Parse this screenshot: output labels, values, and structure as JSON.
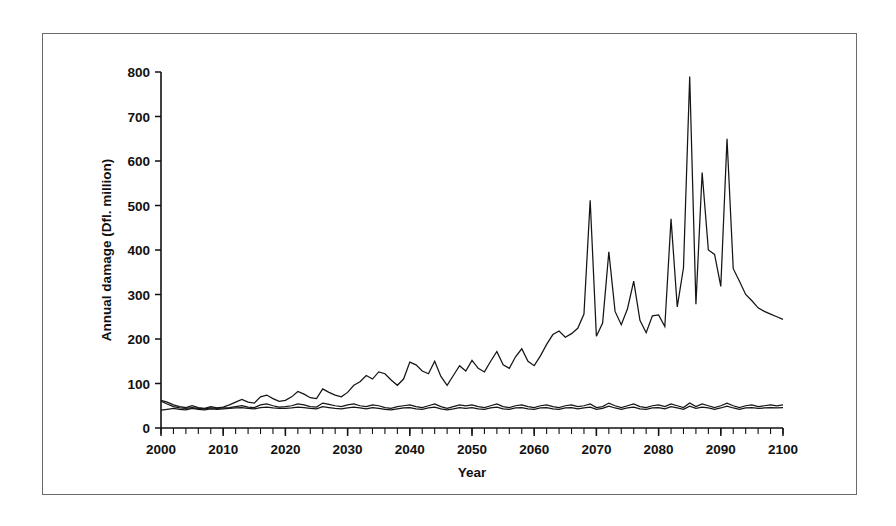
{
  "figure": {
    "border_color": "#6a6a6a",
    "background": "#ffffff"
  },
  "chart_data": {
    "type": "line",
    "title": "",
    "subtitle": "",
    "xlabel": "Year",
    "ylabel": "Annual damage (Dfl. million)",
    "xlim": [
      2000,
      2100
    ],
    "ylim": [
      0,
      800
    ],
    "xticks": [
      2000,
      2010,
      2020,
      2030,
      2040,
      2050,
      2060,
      2070,
      2080,
      2090,
      2100
    ],
    "xtick_labels": [
      "2000",
      "2010",
      "2020",
      "2030",
      "2040",
      "2050",
      "2060",
      "2070",
      "2080",
      "2090",
      "2100"
    ],
    "x_minor_tick_interval": 2,
    "yticks": [
      0,
      100,
      200,
      300,
      400,
      500,
      600,
      700,
      800
    ],
    "ytick_labels": [
      "0",
      "100",
      "200",
      "300",
      "400",
      "500",
      "600",
      "700",
      "800"
    ],
    "grid": false,
    "legend": null,
    "legend_position": "none",
    "line_color": "#151515",
    "x": [
      2000,
      2001,
      2002,
      2003,
      2004,
      2005,
      2006,
      2007,
      2008,
      2009,
      2010,
      2011,
      2012,
      2013,
      2014,
      2015,
      2016,
      2017,
      2018,
      2019,
      2020,
      2021,
      2022,
      2023,
      2024,
      2025,
      2026,
      2027,
      2028,
      2029,
      2030,
      2031,
      2032,
      2033,
      2034,
      2035,
      2036,
      2037,
      2038,
      2039,
      2040,
      2041,
      2042,
      2043,
      2044,
      2045,
      2046,
      2047,
      2048,
      2049,
      2050,
      2051,
      2052,
      2053,
      2054,
      2055,
      2056,
      2057,
      2058,
      2059,
      2060,
      2061,
      2062,
      2063,
      2064,
      2065,
      2066,
      2067,
      2068,
      2069,
      2070,
      2071,
      2072,
      2073,
      2074,
      2075,
      2076,
      2077,
      2078,
      2079,
      2080,
      2081,
      2082,
      2083,
      2084,
      2085,
      2086,
      2087,
      2088,
      2089,
      2090,
      2091,
      2092,
      2093,
      2094,
      2095,
      2096,
      2097,
      2098,
      2099,
      2100
    ],
    "series": [
      {
        "name": "rising-scenario",
        "values": [
          62,
          58,
          52,
          48,
          46,
          50,
          46,
          44,
          48,
          45,
          47,
          52,
          58,
          64,
          58,
          56,
          70,
          74,
          66,
          60,
          62,
          70,
          82,
          76,
          68,
          66,
          88,
          80,
          74,
          70,
          80,
          96,
          104,
          118,
          110,
          126,
          122,
          108,
          96,
          110,
          148,
          142,
          128,
          122,
          150,
          116,
          96,
          118,
          140,
          128,
          152,
          134,
          126,
          150,
          172,
          142,
          134,
          160,
          178,
          150,
          140,
          162,
          188,
          210,
          218,
          204,
          212,
          224,
          256,
          512,
          206,
          236,
          396,
          262,
          232,
          268,
          330,
          242,
          214,
          252,
          254,
          228,
          470,
          272,
          360,
          790,
          278,
          574,
          400,
          390,
          318,
          650,
          358,
          330,
          300,
          286,
          270,
          262,
          256,
          250,
          244
        ]
      },
      {
        "name": "flat-scenario-a",
        "values": [
          60,
          54,
          48,
          45,
          44,
          46,
          44,
          43,
          45,
          44,
          45,
          46,
          48,
          50,
          47,
          46,
          52,
          54,
          50,
          47,
          48,
          50,
          54,
          52,
          48,
          47,
          56,
          53,
          50,
          48,
          52,
          54,
          50,
          48,
          52,
          50,
          46,
          44,
          48,
          50,
          52,
          48,
          46,
          50,
          54,
          48,
          44,
          48,
          52,
          50,
          52,
          48,
          46,
          50,
          54,
          48,
          46,
          50,
          52,
          48,
          46,
          50,
          52,
          48,
          46,
          50,
          52,
          48,
          50,
          54,
          46,
          48,
          56,
          50,
          46,
          50,
          54,
          48,
          46,
          50,
          52,
          48,
          54,
          50,
          46,
          56,
          48,
          54,
          50,
          46,
          50,
          56,
          50,
          46,
          50,
          52,
          48,
          50,
          52,
          50,
          52
        ]
      },
      {
        "name": "flat-scenario-b",
        "values": [
          40,
          42,
          44,
          42,
          41,
          44,
          42,
          41,
          43,
          42,
          43,
          44,
          45,
          46,
          44,
          43,
          46,
          47,
          45,
          44,
          44,
          45,
          47,
          46,
          44,
          43,
          48,
          46,
          44,
          43,
          45,
          47,
          45,
          43,
          46,
          44,
          42,
          41,
          43,
          45,
          46,
          43,
          42,
          45,
          47,
          43,
          41,
          43,
          46,
          44,
          46,
          43,
          42,
          45,
          47,
          43,
          42,
          45,
          46,
          43,
          42,
          45,
          46,
          43,
          42,
          45,
          46,
          43,
          45,
          47,
          42,
          44,
          49,
          45,
          42,
          45,
          47,
          43,
          42,
          45,
          46,
          43,
          48,
          45,
          42,
          49,
          44,
          47,
          45,
          42,
          45,
          49,
          45,
          42,
          45,
          46,
          44,
          45,
          46,
          45,
          46
        ]
      }
    ]
  }
}
